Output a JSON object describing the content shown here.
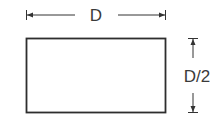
{
  "diagram": {
    "shape": "rectangle",
    "width_label": "D",
    "height_label": "D/2",
    "stroke_color": "#2e2e2e",
    "dimension_color": "#333333"
  }
}
